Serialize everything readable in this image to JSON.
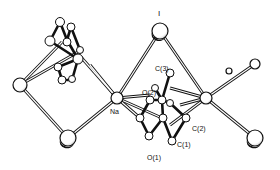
{
  "figure": {
    "type": "crystal-structure-ORTEP",
    "background": "#ffffff",
    "ink": "#111111"
  },
  "labels": {
    "I": "I",
    "Na": "Na",
    "C3": "C(3)",
    "O2": "O(2)",
    "C2": "C(2)",
    "C1": "C(1)",
    "O1": "O(1)"
  },
  "atoms": {
    "left_vertex": {
      "x": 20,
      "y": 85,
      "r": 7
    },
    "bottom_left_I": {
      "x": 68,
      "y": 138,
      "r": 8
    },
    "Na": {
      "x": 117,
      "y": 98,
      "r": 6
    },
    "top_I": {
      "x": 160,
      "y": 31,
      "r": 8
    },
    "Na_prime": {
      "x": 206,
      "y": 98,
      "r": 6
    },
    "right_upper": {
      "x": 255,
      "y": 64,
      "r": 5
    },
    "right_small": {
      "x": 229,
      "y": 71,
      "r": 3
    },
    "bottom_right_I": {
      "x": 255,
      "y": 138,
      "r": 8
    }
  }
}
